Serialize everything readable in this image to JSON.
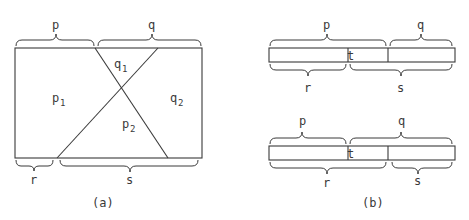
{
  "figure_a": {
    "caption": "(a)",
    "top_labels": {
      "left": "p",
      "right": "q"
    },
    "bottom_labels": {
      "left": "r",
      "right": "s"
    },
    "regions": [
      {
        "base": "p",
        "sub": "1"
      },
      {
        "base": "q",
        "sub": "1"
      },
      {
        "base": "p",
        "sub": "2"
      },
      {
        "base": "q",
        "sub": "2"
      }
    ]
  },
  "figure_b": {
    "caption": "(b)",
    "top_bar": {
      "above": {
        "left": "p",
        "right": "q"
      },
      "below": {
        "left": "r",
        "right": "s"
      },
      "middle": "t"
    },
    "bottom_bar": {
      "above": {
        "left": "p",
        "right": "q"
      },
      "below": {
        "left": "r",
        "right": "s"
      },
      "middle": "t"
    }
  }
}
